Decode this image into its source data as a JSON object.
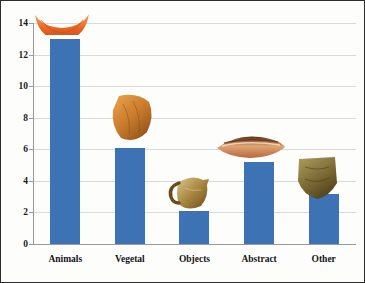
{
  "chart_data": {
    "type": "bar",
    "title": "",
    "xlabel": "",
    "ylabel": "",
    "categories": [
      "Animals",
      "Vegetal",
      "Objects",
      "Abstract",
      "Other"
    ],
    "values": [
      13.0,
      6.1,
      2.1,
      5.2,
      3.2
    ],
    "ylim": [
      0,
      14
    ],
    "yticks": [
      0,
      2,
      4,
      6,
      8,
      10,
      12,
      14
    ],
    "ytick_labels": [
      "0",
      "2",
      "4",
      "6",
      "8",
      "10",
      "12",
      "14"
    ],
    "grid": true,
    "legend": "none",
    "bar_color": "#3d72b4",
    "gridline_color": "#d9d9d9",
    "axis_color": "#9a9a9a",
    "border_color": "#2b2b2b",
    "background_color": "#fdfdfc"
  },
  "artifacts": [
    {
      "name": "animal-motif-sherd",
      "category": "Animals",
      "description": "orange crescent-shaped painted sherd",
      "colors": [
        "#e8631f",
        "#f4a266",
        "#c4491a"
      ]
    },
    {
      "name": "vegetal-motif-sherd",
      "category": "Vegetal",
      "description": "orange-brown pottery sherd with vegetal decoration",
      "colors": [
        "#c97a2b",
        "#e8a14a",
        "#8a4f17"
      ]
    },
    {
      "name": "object-motif-jug",
      "category": "Objects",
      "description": "small handled jug vessel",
      "colors": [
        "#a8863f",
        "#6b4a1e",
        "#d8c78f"
      ]
    },
    {
      "name": "abstract-motif-sherd",
      "category": "Abstract",
      "description": "elongated leaf-shaped decorated sherd",
      "colors": [
        "#b5693a",
        "#e0a477",
        "#5e2f15"
      ]
    },
    {
      "name": "other-motif-sherd",
      "category": "Other",
      "description": "dark olive angular pottery sherd",
      "colors": [
        "#7c6a34",
        "#a79758",
        "#4a3c18"
      ]
    }
  ]
}
